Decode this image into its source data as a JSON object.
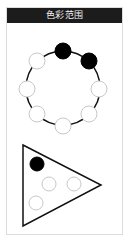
{
  "panel": {
    "title": "色彩范围"
  },
  "colors": {
    "header_bg": "#1c1c1c",
    "header_text": "#f2f2f2",
    "stroke": "#111111",
    "filled": "#000000",
    "empty_fill": "#ffffff",
    "empty_stroke": "#c8c8c8",
    "border": "#dcdcdc"
  },
  "ring": {
    "center": [
      63,
      88
    ],
    "radius": 37,
    "dot_radius": 8,
    "dots": [
      {
        "pos": [
          63,
          51
        ],
        "state": "filled"
      },
      {
        "pos": [
          89,
          61
        ],
        "state": "filled"
      },
      {
        "pos": [
          99,
          89
        ],
        "state": "empty"
      },
      {
        "pos": [
          89,
          114
        ],
        "state": "empty"
      },
      {
        "pos": [
          63,
          126
        ],
        "state": "empty"
      },
      {
        "pos": [
          37,
          114
        ],
        "state": "empty"
      },
      {
        "pos": [
          27,
          89
        ],
        "state": "empty"
      },
      {
        "pos": [
          37,
          61
        ],
        "state": "empty"
      }
    ]
  },
  "triangle": {
    "vertices": [
      [
        23,
        145
      ],
      [
        101,
        185
      ],
      [
        23,
        226
      ]
    ],
    "dot_radius": 7,
    "dots": [
      {
        "pos": [
          37,
          164
        ],
        "state": "filled"
      },
      {
        "pos": [
          49,
          184
        ],
        "state": "empty"
      },
      {
        "pos": [
          74,
          184
        ],
        "state": "empty"
      },
      {
        "pos": [
          36,
          203
        ],
        "state": "empty"
      }
    ]
  }
}
